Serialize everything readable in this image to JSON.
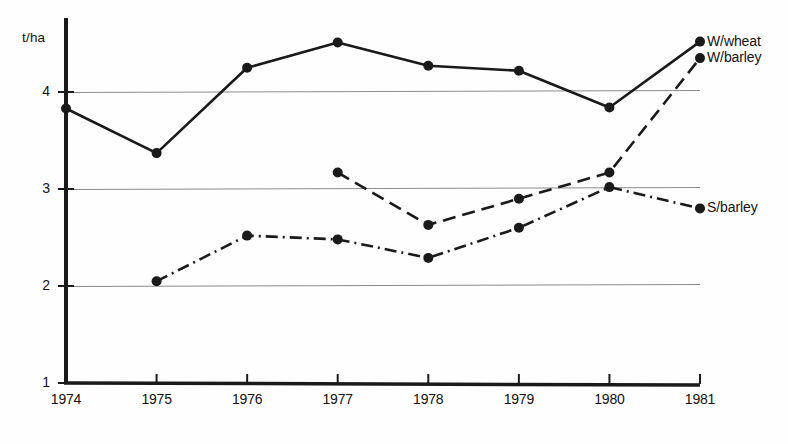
{
  "chart_data": {
    "type": "line",
    "title": "",
    "xlabel": "",
    "ylabel": "t/ha",
    "categories": [
      "1974",
      "1975",
      "1976",
      "1977",
      "1978",
      "1979",
      "1980",
      "1981"
    ],
    "x": [
      1974,
      1975,
      1976,
      1977,
      1978,
      1979,
      1980,
      1981
    ],
    "ylim": [
      1,
      4.7
    ],
    "xlim": [
      1974,
      1981
    ],
    "yticks": [
      1,
      2,
      3,
      4
    ],
    "ytick_labels": [
      "1",
      "2",
      "3",
      "4"
    ],
    "grid": "horizontal gridlines at 2, 3 and 4",
    "legend_position": "right-of-line-ends",
    "series": [
      {
        "name": "W/wheat",
        "label": "W/wheat",
        "style": "solid",
        "marker": "filled-circle",
        "color": "#1a1a1a",
        "x": [
          1974,
          1975,
          1976,
          1977,
          1978,
          1979,
          1980,
          1981
        ],
        "values": [
          3.83,
          3.37,
          4.25,
          4.51,
          4.27,
          4.22,
          3.84,
          4.52
        ]
      },
      {
        "name": "W/barley",
        "label": "W/barley",
        "style": "dashed",
        "marker": "filled-circle",
        "color": "#1a1a1a",
        "x": [
          1977,
          1978,
          1979,
          1980,
          1981
        ],
        "values": [
          3.17,
          2.63,
          2.9,
          3.17,
          4.35
        ]
      },
      {
        "name": "S/barley",
        "label": "S/barley",
        "style": "dash-dot",
        "marker": "filled-circle",
        "color": "#1a1a1a",
        "x": [
          1975,
          1976,
          1977,
          1978,
          1979,
          1980,
          1981
        ],
        "values": [
          2.05,
          2.52,
          2.48,
          2.29,
          2.6,
          3.02,
          2.8
        ]
      }
    ]
  },
  "axis": {
    "unit_label": "t/ha"
  },
  "colors": {
    "ink": "#1a1a1a",
    "gridline": "#8a8a8a",
    "background": "#fefefe"
  }
}
